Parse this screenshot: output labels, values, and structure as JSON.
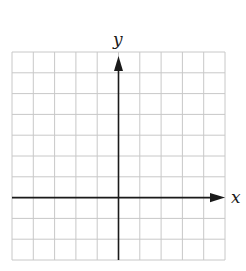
{
  "diagram": {
    "type": "coordinate-grid",
    "x_axis_label": "x",
    "y_axis_label": "y",
    "grid": {
      "columns": 10,
      "rows": 10,
      "origin_column": 5,
      "origin_row_from_top": 7
    },
    "colors": {
      "grid": "#c8c8c8",
      "axis": "#1a1a1a",
      "background": "#ffffff"
    }
  }
}
